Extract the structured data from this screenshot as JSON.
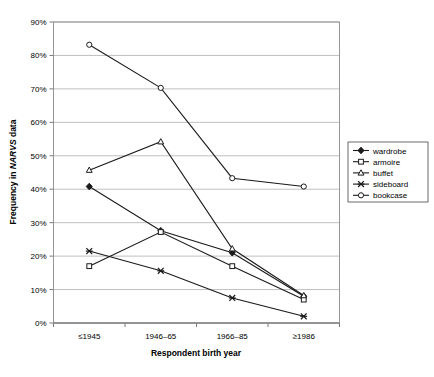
{
  "chart_data": {
    "type": "line",
    "title": "",
    "xlabel": "Respondent birth year",
    "ylabel_prefix": "Frequency in ",
    "ylabel_italic": "NARVS",
    "ylabel_suffix": " data",
    "categories": [
      "≤1945",
      "1946–65",
      "1966–85",
      "≥1986"
    ],
    "ylim": [
      0,
      90
    ],
    "ytick_labels": [
      "0%",
      "10%",
      "20%",
      "30%",
      "40%",
      "50%",
      "60%",
      "70%",
      "80%",
      "90%"
    ],
    "ytick_values": [
      0,
      10,
      20,
      30,
      40,
      50,
      60,
      70,
      80,
      90
    ],
    "grid": true,
    "legend_position": "right",
    "series": [
      {
        "name": "wardrobe",
        "marker": "filled-diamond",
        "values": [
          40.8,
          27.6,
          21.0,
          8.0
        ]
      },
      {
        "name": "armoire",
        "marker": "open-square",
        "values": [
          17.0,
          27.2,
          17.0,
          7.0
        ]
      },
      {
        "name": "buffet",
        "marker": "open-triangle",
        "values": [
          45.7,
          54.2,
          22.2,
          8.2
        ]
      },
      {
        "name": "sideboard",
        "marker": "cross-x",
        "values": [
          21.5,
          15.6,
          7.5,
          2.0
        ]
      },
      {
        "name": "bookcase",
        "marker": "open-circle",
        "values": [
          83.2,
          70.3,
          43.3,
          40.8
        ]
      }
    ]
  }
}
